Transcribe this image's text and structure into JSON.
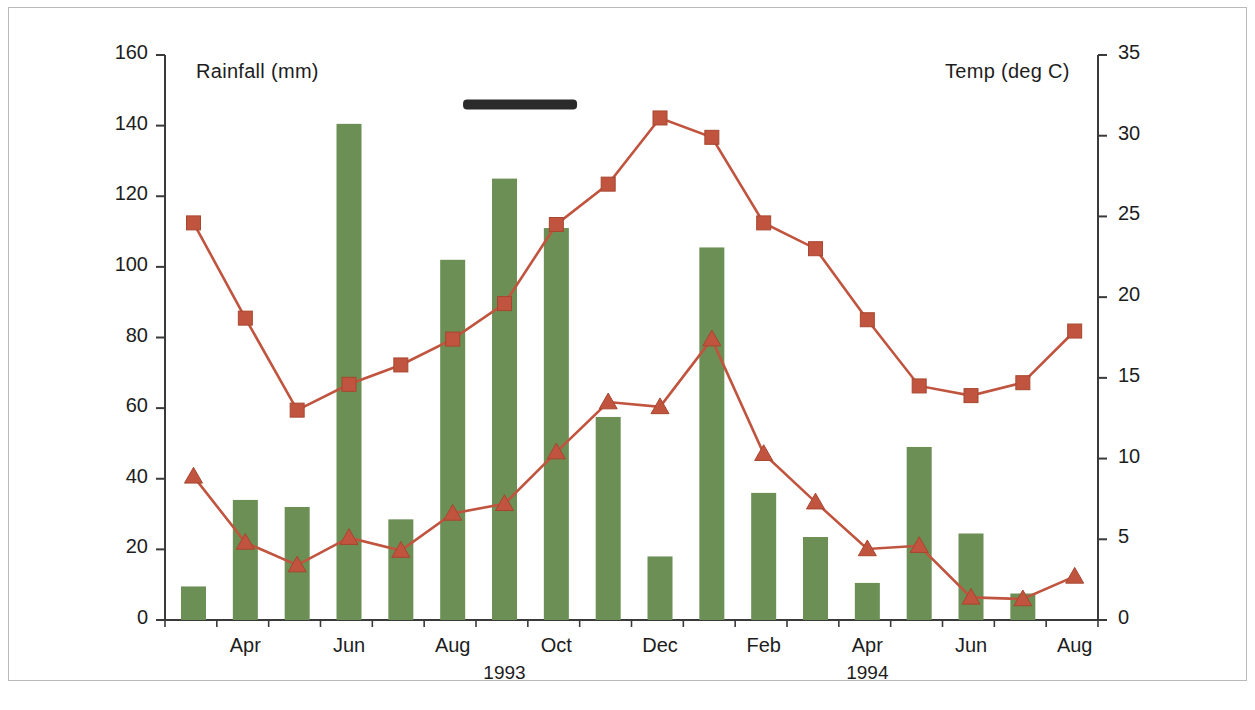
{
  "figure": {
    "background_color": "#ffffff",
    "border_color": "#b9b9b9"
  },
  "chart_data": {
    "type": "bar",
    "title": "",
    "subtitle": "",
    "xlabel": "",
    "ylabel": "Rainfall (mm)",
    "y2label": "Temp (deg C)",
    "ylim": [
      0,
      160
    ],
    "y2lim": [
      0,
      35
    ],
    "grid": false,
    "legend": null,
    "bar_color": "#6b8f54",
    "line_color": "#c0543f",
    "annotation_bar_color": "#2b2b2b",
    "yticks": [
      0,
      20,
      40,
      60,
      80,
      100,
      120,
      140,
      160
    ],
    "y2ticks": [
      0,
      5,
      10,
      15,
      20,
      25,
      30,
      35
    ],
    "categories": [
      "Mar 1993",
      "Apr 1993",
      "May 1993",
      "Jun 1993",
      "Jul 1993",
      "Aug 1993",
      "Sep 1993",
      "Oct 1993",
      "Nov 1993",
      "Dec 1993",
      "Jan 1994",
      "Feb 1994",
      "Mar 1994",
      "Apr 1994",
      "May 1994",
      "Jun 1994",
      "Jul 1994",
      "Aug 1994"
    ],
    "xtick_labels": [
      "Apr",
      "Jun",
      "Aug",
      "Oct",
      "Dec",
      "Feb",
      "Apr",
      "Jun",
      "Aug"
    ],
    "xtick_indices": [
      1,
      3,
      5,
      7,
      9,
      11,
      13,
      15,
      17
    ],
    "year_labels": [
      {
        "text": "1993",
        "index": 6.0
      },
      {
        "text": "1994",
        "index": 13.0
      }
    ],
    "series": [
      {
        "name": "Rainfall (mm)",
        "type": "bar",
        "axis": "left",
        "color": "#6b8f54",
        "values": [
          9.5,
          34,
          32,
          140.5,
          28.5,
          102,
          125,
          111,
          57.5,
          18,
          105.5,
          36,
          23.5,
          10.5,
          49,
          24.5,
          7.5,
          0
        ]
      },
      {
        "name": "Maximum temperature",
        "type": "line",
        "marker": "square",
        "axis": "right",
        "color": "#c0543f",
        "values": [
          24.6,
          18.7,
          13.0,
          14.6,
          15.8,
          17.4,
          19.6,
          24.5,
          27.0,
          31.1,
          29.9,
          24.6,
          23.0,
          18.6,
          14.5,
          13.9,
          14.7,
          17.9
        ]
      },
      {
        "name": "Minimum temperature",
        "type": "line",
        "marker": "triangle",
        "axis": "right",
        "color": "#c0543f",
        "values": [
          8.9,
          4.8,
          3.4,
          5.1,
          4.3,
          6.6,
          7.2,
          10.4,
          13.5,
          13.2,
          17.4,
          10.3,
          7.3,
          4.4,
          4.6,
          1.4,
          1.3,
          2.7
        ]
      }
    ],
    "annotations": [
      {
        "type": "horizontal-bar",
        "label": "",
        "color": "#2b2b2b",
        "x_start_index": 5.2,
        "x_end_index": 7.4,
        "y_value": 146
      }
    ]
  }
}
